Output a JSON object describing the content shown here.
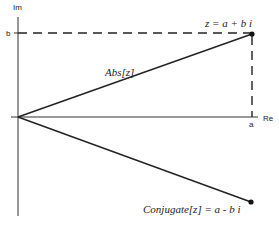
{
  "diagram": {
    "axes": {
      "x_label": "Re",
      "y_label": "Im",
      "x_tick": "a",
      "y_tick": "b"
    },
    "labels": {
      "modulus": "Abs[z]",
      "point": "z = a + b i",
      "conjugate": "Conjugate[z] = a - b i"
    },
    "colors": {
      "line": "#222222",
      "background": "#ffffff"
    }
  }
}
